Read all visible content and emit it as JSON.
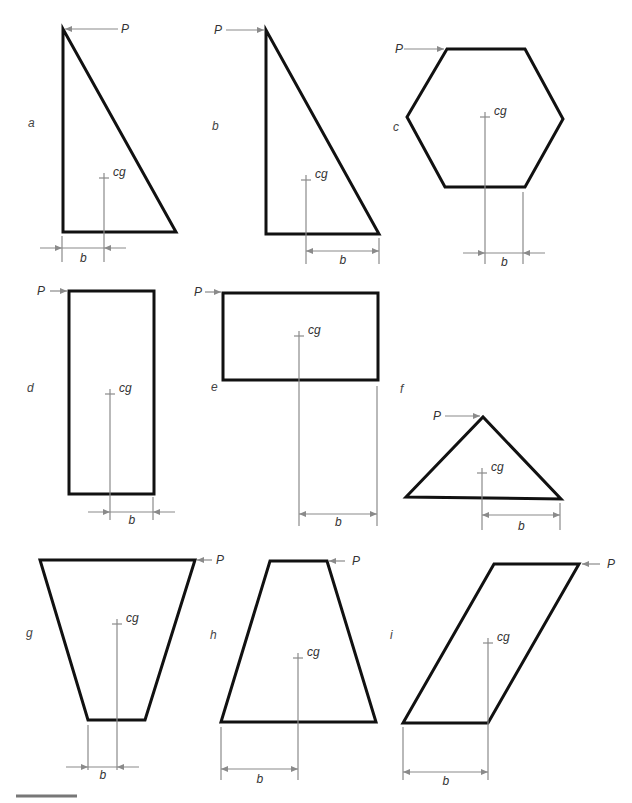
{
  "figure": {
    "labels": {
      "force": "P",
      "cog": "cg",
      "arm": "b"
    },
    "colors": {
      "outline": "#111111",
      "annotation": "#8a8a8a",
      "text": "#333333"
    },
    "panels": [
      {
        "id": "a",
        "label": "a",
        "shape": "right triangle, vertical side left",
        "force_side": "right",
        "force_direction": "left"
      },
      {
        "id": "b",
        "label": "b",
        "shape": "right triangle, vertical side left",
        "force_side": "left",
        "force_direction": "right"
      },
      {
        "id": "c",
        "label": "c",
        "shape": "hexagon",
        "force_side": "left",
        "force_direction": "right"
      },
      {
        "id": "d",
        "label": "d",
        "shape": "tall rectangle",
        "force_side": "left",
        "force_direction": "right"
      },
      {
        "id": "e",
        "label": "e",
        "shape": "wide rectangle (raised)",
        "force_side": "left",
        "force_direction": "right"
      },
      {
        "id": "f",
        "label": "f",
        "shape": "isosceles triangle",
        "force_side": "left",
        "force_direction": "right"
      },
      {
        "id": "g",
        "label": "g",
        "shape": "inverted trapezoid",
        "force_side": "right",
        "force_direction": "left"
      },
      {
        "id": "h",
        "label": "h",
        "shape": "trapezoid",
        "force_side": "right",
        "force_direction": "left"
      },
      {
        "id": "i",
        "label": "i",
        "shape": "parallelogram",
        "force_side": "right",
        "force_direction": "left"
      }
    ]
  }
}
